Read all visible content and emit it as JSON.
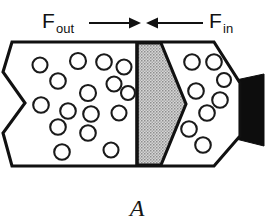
{
  "figure": {
    "caption": "A",
    "labels": {
      "force_out": {
        "base": "F",
        "subscript": "out"
      },
      "force_in": {
        "base": "F",
        "subscript": "in"
      }
    },
    "arrows": [
      {
        "name": "arrow-out",
        "direction": "right",
        "label": "F_out"
      },
      {
        "name": "arrow-in",
        "direction": "left",
        "label": "F_in"
      }
    ],
    "colors": {
      "outline": "#111111",
      "fill": "#ffffff",
      "shading": "#b8b8b8",
      "nozzle": "#0d0d0d",
      "particle_stroke": "#1a1a1a"
    },
    "regions": {
      "left_chamber": {
        "name": "left-chamber",
        "particle_count": 16,
        "shading": "none"
      },
      "shaded_wedge": {
        "name": "shaded-wedge",
        "particle_count": 0,
        "shading": "gray-halftone"
      },
      "right_chamber": {
        "name": "right-chamber",
        "particle_count": 8,
        "shading": "none"
      },
      "nozzle": {
        "name": "nozzle-outlet",
        "fill": "solid-black"
      }
    },
    "geometry": {
      "vessel_outline": "12,42 112,42 112,165 12,165",
      "left_zigzag": "12,42 3,72 25,103 3,133 12,165",
      "divider_x": 137,
      "wedge": "137,42 160,42 184,103 160,165 137,165",
      "nozzle_rect": "237,82 262,78 262,140 237,135"
    },
    "particles": {
      "left": [
        {
          "cx": 40,
          "cy": 65,
          "r": 7.5
        },
        {
          "cx": 78,
          "cy": 61,
          "r": 8.0
        },
        {
          "cx": 104,
          "cy": 62,
          "r": 7.8
        },
        {
          "cx": 124,
          "cy": 67,
          "r": 7.5
        },
        {
          "cx": 58,
          "cy": 81,
          "r": 7.8
        },
        {
          "cx": 114,
          "cy": 84,
          "r": 7.5
        },
        {
          "cx": 88,
          "cy": 93,
          "r": 8.0
        },
        {
          "cx": 41,
          "cy": 105,
          "r": 7.8
        },
        {
          "cx": 68,
          "cy": 111,
          "r": 7.8
        },
        {
          "cx": 91,
          "cy": 114,
          "r": 7.8
        },
        {
          "cx": 119,
          "cy": 113,
          "r": 7.5
        },
        {
          "cx": 58,
          "cy": 127,
          "r": 7.8
        },
        {
          "cx": 88,
          "cy": 133,
          "r": 7.8
        },
        {
          "cx": 62,
          "cy": 152,
          "r": 7.8
        },
        {
          "cx": 111,
          "cy": 150,
          "r": 7.5
        },
        {
          "cx": 128,
          "cy": 93,
          "r": 7.0
        }
      ],
      "right": [
        {
          "cx": 192,
          "cy": 62,
          "r": 7.8
        },
        {
          "cx": 214,
          "cy": 62,
          "r": 7.8
        },
        {
          "cx": 196,
          "cy": 91,
          "r": 7.8
        },
        {
          "cx": 220,
          "cy": 100,
          "r": 7.8
        },
        {
          "cx": 207,
          "cy": 113,
          "r": 7.8
        },
        {
          "cx": 189,
          "cy": 129,
          "r": 7.8
        },
        {
          "cx": 203,
          "cy": 145,
          "r": 7.8
        },
        {
          "cx": 224,
          "cy": 80,
          "r": 7.0
        }
      ]
    }
  }
}
